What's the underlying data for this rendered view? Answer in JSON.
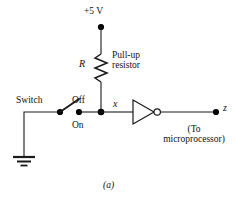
{
  "figure": {
    "caption": "(a)"
  },
  "labels": {
    "supply": "+5 V",
    "resistor_symbol": "R",
    "resistor_name_line1": "Pull-up",
    "resistor_name_line2": "resistor",
    "switch": "Switch",
    "switch_position_open": "Off",
    "switch_position_closed": "On",
    "node_x": "x",
    "node_z": "z",
    "destination_line1": "(To",
    "destination_line2": "microprocessor)"
  },
  "components": {
    "power_supply": {
      "name": "voltage-source",
      "value": "+5 V"
    },
    "resistor": {
      "name": "pull-up-resistor",
      "designator": "R"
    },
    "switch": {
      "name": "spst-switch",
      "state": "Off"
    },
    "inverter": {
      "name": "not-gate",
      "input": "x",
      "output": "z"
    },
    "ground": {
      "name": "ground-symbol"
    }
  },
  "colors": {
    "background": "#ffffff",
    "wire": "#1a1a1a",
    "text": "#111111",
    "node_fill": "#000000"
  }
}
